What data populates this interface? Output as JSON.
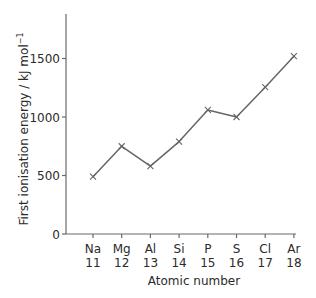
{
  "chart_data": {
    "type": "line",
    "title": "",
    "xlabel": "Atomic number",
    "ylabel": "First ionisation energy / kJ mol⁻¹",
    "ylabel_main": "First ionisation energy / kJ mol",
    "ylabel_sup": "−1",
    "categories": [
      {
        "symbol": "Na",
        "number": "11"
      },
      {
        "symbol": "Mg",
        "number": "12"
      },
      {
        "symbol": "Al",
        "number": "13"
      },
      {
        "symbol": "Si",
        "number": "14"
      },
      {
        "symbol": "P",
        "number": "15"
      },
      {
        "symbol": "S",
        "number": "16"
      },
      {
        "symbol": "Cl",
        "number": "17"
      },
      {
        "symbol": "Ar",
        "number": "18"
      }
    ],
    "series": [
      {
        "name": "First ionisation energy",
        "values": [
          490,
          750,
          580,
          790,
          1060,
          1000,
          1255,
          1520
        ],
        "marker": "x"
      }
    ],
    "yticks": [
      0,
      500,
      1000,
      1500
    ],
    "ytick_labels": [
      "0",
      "500",
      "1000",
      "1500"
    ],
    "ylim": [
      0,
      1870
    ],
    "grid": false,
    "legend": null
  },
  "colors": {
    "line": "#666666",
    "axis": "#6a6a6a",
    "text": "#2b2b2b",
    "background": "#ffffff"
  }
}
